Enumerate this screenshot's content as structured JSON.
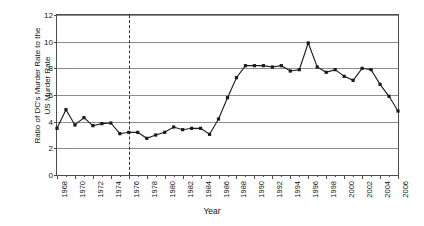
{
  "chart_data": {
    "type": "line",
    "title": "",
    "xlabel": "Year",
    "ylabel": "Ratio of DC's Murder Rate to the\nUS Murder Rate",
    "ylim": [
      0,
      12
    ],
    "ytick_values": [
      0,
      2,
      4,
      6,
      8,
      10,
      12
    ],
    "ytick_labels": [
      "0",
      "2",
      "4",
      "6",
      "8",
      "10",
      "12"
    ],
    "xlim": [
      1968,
      2006
    ],
    "xtick_labels": [
      "1968",
      "1970",
      "1972",
      "1974",
      "1976",
      "1978",
      "1980",
      "1982",
      "1984",
      "1986",
      "1988",
      "1990",
      "1992",
      "1994",
      "1996",
      "1998",
      "2000",
      "2002",
      "2004",
      "2006"
    ],
    "grid": "horizontal",
    "legend": "none",
    "annotations": [
      {
        "name": "reference-line",
        "type": "vertical-dashed",
        "x": 1976
      }
    ],
    "series": [
      {
        "name": "DC to US murder rate ratio",
        "color": "#1a1a1a",
        "marker": "square",
        "x": [
          1968,
          1969,
          1970,
          1971,
          1972,
          1973,
          1974,
          1975,
          1976,
          1977,
          1978,
          1979,
          1980,
          1981,
          1982,
          1983,
          1984,
          1985,
          1986,
          1987,
          1988,
          1989,
          1990,
          1991,
          1992,
          1993,
          1994,
          1995,
          1996,
          1997,
          1998,
          1999,
          2000,
          2001,
          2002,
          2003,
          2004,
          2005,
          2006
        ],
        "y": [
          3.5,
          4.9,
          3.75,
          4.3,
          3.7,
          3.85,
          3.9,
          3.1,
          3.2,
          3.2,
          2.75,
          3.0,
          3.2,
          3.6,
          3.4,
          3.5,
          3.5,
          3.05,
          4.2,
          5.8,
          7.3,
          8.2,
          8.2,
          8.2,
          8.1,
          8.2,
          7.8,
          7.9,
          9.9,
          8.1,
          7.7,
          7.9,
          7.4,
          7.1,
          8.0,
          7.9,
          6.8,
          5.9,
          4.8
        ]
      }
    ]
  }
}
